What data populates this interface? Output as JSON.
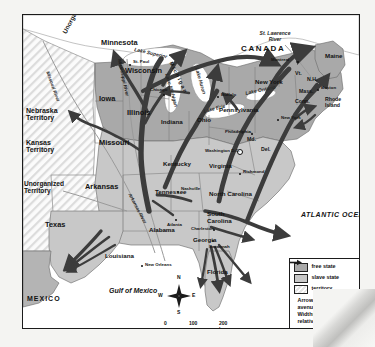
{
  "map": {
    "title": "Routes of the Underground Railroad",
    "countries": [
      {
        "name": "CANADA"
      },
      {
        "name": "MEXICO"
      }
    ],
    "oceans": [
      {
        "name": "ATLANTIC OCEAN"
      },
      {
        "name": "Gulf of Mexico"
      }
    ],
    "lakes": [
      {
        "name": "Lake Superior"
      },
      {
        "name": "Lake Michigan"
      },
      {
        "name": "Lake Huron"
      },
      {
        "name": "Lake Erie"
      },
      {
        "name": "Lake Ontario"
      }
    ],
    "rivers": [
      {
        "name": "Missouri River"
      },
      {
        "name": "Mississippi River"
      },
      {
        "name": "Arkansas River"
      },
      {
        "name": "St. Lawrence River"
      }
    ],
    "territories": [
      {
        "name": "Unorganized Territory"
      },
      {
        "name": "Nebraska Territory"
      },
      {
        "name": "Kansas Territory"
      },
      {
        "name": "Unorganized Territory"
      }
    ],
    "free_states": [
      {
        "name": "Minnesota"
      },
      {
        "name": "Iowa"
      },
      {
        "name": "Wisconsin"
      },
      {
        "name": "Michigan"
      },
      {
        "name": "Illinois"
      },
      {
        "name": "Indiana"
      },
      {
        "name": "Ohio"
      },
      {
        "name": "Pennsylvania"
      },
      {
        "name": "New York"
      },
      {
        "name": "Maine"
      },
      {
        "name": "Vt."
      },
      {
        "name": "N.H."
      },
      {
        "name": "Mass."
      },
      {
        "name": "Conn."
      },
      {
        "name": "Rhode Island"
      }
    ],
    "slave_states": [
      {
        "name": "Missouri"
      },
      {
        "name": "Arkansas"
      },
      {
        "name": "Texas"
      },
      {
        "name": "Louisiana"
      },
      {
        "name": "Kentucky"
      },
      {
        "name": "Tennessee"
      },
      {
        "name": "Alabama"
      },
      {
        "name": "Georgia"
      },
      {
        "name": "Florida"
      },
      {
        "name": "South Carolina"
      },
      {
        "name": "North Carolina"
      },
      {
        "name": "Virginia"
      },
      {
        "name": "Md."
      },
      {
        "name": "Del."
      }
    ],
    "cities": [
      {
        "name": "St. Paul"
      },
      {
        "name": "Chicago"
      },
      {
        "name": "Nashville"
      },
      {
        "name": "Atlanta"
      },
      {
        "name": "Charleston"
      },
      {
        "name": "Savannah"
      },
      {
        "name": "New Orleans"
      },
      {
        "name": "Richmond"
      },
      {
        "name": "Washington D.C."
      },
      {
        "name": "Philadelphia"
      },
      {
        "name": "New York"
      },
      {
        "name": "Boston"
      },
      {
        "name": "Buffalo"
      },
      {
        "name": "Montreal"
      }
    ]
  },
  "legend": {
    "items": [
      {
        "key": "free-state",
        "label": "free state"
      },
      {
        "key": "slave-state",
        "label": "slave state"
      },
      {
        "key": "territory",
        "label": "territory"
      }
    ],
    "arrow_note": "Arrows show major avenues of escape. Widths indicate relative numbers of runaway slaves."
  },
  "compass": {
    "north": "N",
    "south": "S",
    "east": "E",
    "west": "W"
  },
  "scale": {
    "zero": "0",
    "mid": "100",
    "max": "200 km"
  },
  "colors": {
    "free_state": "#a9a9a9",
    "slave_state": "#c8c8c8",
    "territory": "#e8e8e8",
    "arrow": "#3c3c3c",
    "frame": "#1b1b1b"
  }
}
